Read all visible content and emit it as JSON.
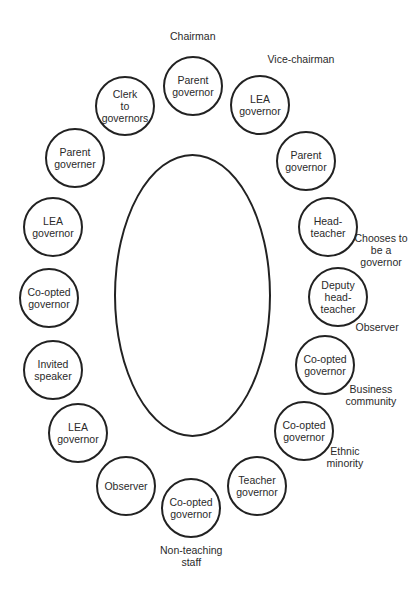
{
  "diagram": {
    "type": "seating-plan",
    "table": {
      "cx": 193,
      "cy": 296,
      "rx": 79,
      "ry": 142
    },
    "seats": [
      {
        "id": "seat-1",
        "label": "Parent\ngovernor",
        "cx": 193,
        "cy": 86
      },
      {
        "id": "seat-2",
        "label": "LEA\ngovernor",
        "cx": 260,
        "cy": 105
      },
      {
        "id": "seat-3",
        "label": "Parent\ngovernor",
        "cx": 306,
        "cy": 161
      },
      {
        "id": "seat-4",
        "label": "Head-\nteacher",
        "cx": 328,
        "cy": 227
      },
      {
        "id": "seat-5",
        "label": "Deputy\nhead-\nteacher",
        "cx": 338,
        "cy": 297
      },
      {
        "id": "seat-6",
        "label": "Co-opted\ngovernor",
        "cx": 325,
        "cy": 365
      },
      {
        "id": "seat-7",
        "label": "Co-opted\ngovernor",
        "cx": 304,
        "cy": 431
      },
      {
        "id": "seat-8",
        "label": "Teacher\ngovernor",
        "cx": 257,
        "cy": 486
      },
      {
        "id": "seat-9",
        "label": "Co-opted\ngovernor",
        "cx": 191,
        "cy": 508
      },
      {
        "id": "seat-10",
        "label": "Observer",
        "cx": 126,
        "cy": 486
      },
      {
        "id": "seat-11",
        "label": "LEA\ngovernor",
        "cx": 78,
        "cy": 433
      },
      {
        "id": "seat-12",
        "label": "Invited\nspeaker",
        "cx": 53,
        "cy": 370
      },
      {
        "id": "seat-13",
        "label": "Co-opted\ngovernor",
        "cx": 49,
        "cy": 298
      },
      {
        "id": "seat-14",
        "label": "LEA\ngovernor",
        "cx": 53,
        "cy": 227
      },
      {
        "id": "seat-15",
        "label": "Parent\ngoverner",
        "cx": 75,
        "cy": 158
      },
      {
        "id": "seat-16",
        "label": "Clerk\nto\ngovernors",
        "cx": 125,
        "cy": 106
      }
    ],
    "annotations": [
      {
        "id": "note-chairman",
        "text": "Chairman",
        "x": 193,
        "y": 36
      },
      {
        "id": "note-vice",
        "text": "Vice-chairman",
        "x": 301,
        "y": 59
      },
      {
        "id": "note-chooses",
        "text": "Chooses to\nbe a\ngovernor",
        "x": 381,
        "y": 250
      },
      {
        "id": "note-observer",
        "text": "Observer",
        "x": 377,
        "y": 327
      },
      {
        "id": "note-business",
        "text": "Business\ncommunity",
        "x": 371,
        "y": 395
      },
      {
        "id": "note-ethnic",
        "text": "Ethnic\nminority",
        "x": 345,
        "y": 457
      },
      {
        "id": "note-nonteaching",
        "text": "Non-teaching\nstaff",
        "x": 191,
        "y": 556
      }
    ]
  }
}
